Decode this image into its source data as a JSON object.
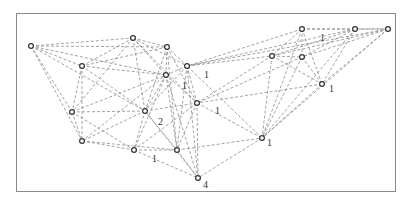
{
  "diagram": {
    "type": "network-graph",
    "edge_style": "dashed",
    "edge_color": "#8c8c8c",
    "node_color": "#333333",
    "nodes": [
      {
        "id": "A",
        "x": 31,
        "y": 46
      },
      {
        "id": "B",
        "x": 133,
        "y": 38
      },
      {
        "id": "C",
        "x": 167,
        "y": 47
      },
      {
        "id": "D",
        "x": 82,
        "y": 66
      },
      {
        "id": "E",
        "x": 187,
        "y": 66
      },
      {
        "id": "F",
        "x": 166,
        "y": 75
      },
      {
        "id": "G",
        "x": 302,
        "y": 29
      },
      {
        "id": "H",
        "x": 355,
        "y": 29
      },
      {
        "id": "I",
        "x": 388,
        "y": 29
      },
      {
        "id": "J",
        "x": 272,
        "y": 56
      },
      {
        "id": "K",
        "x": 302,
        "y": 57
      },
      {
        "id": "L",
        "x": 322,
        "y": 84
      },
      {
        "id": "M",
        "x": 72,
        "y": 112
      },
      {
        "id": "N",
        "x": 145,
        "y": 111
      },
      {
        "id": "O",
        "x": 197,
        "y": 103
      },
      {
        "id": "P",
        "x": 82,
        "y": 141
      },
      {
        "id": "Q",
        "x": 134,
        "y": 150
      },
      {
        "id": "R",
        "x": 177,
        "y": 150
      },
      {
        "id": "S",
        "x": 262,
        "y": 138
      },
      {
        "id": "T",
        "x": 198,
        "y": 178
      }
    ],
    "labels": [
      {
        "text": "1",
        "x": 204,
        "y": 78
      },
      {
        "text": "1",
        "x": 182,
        "y": 89
      },
      {
        "text": "1",
        "x": 320,
        "y": 41
      },
      {
        "text": "1",
        "x": 329,
        "y": 92
      },
      {
        "text": "2",
        "x": 158,
        "y": 125
      },
      {
        "text": "1",
        "x": 215,
        "y": 114
      },
      {
        "text": "1",
        "x": 152,
        "y": 162
      },
      {
        "text": "1",
        "x": 267,
        "y": 146
      },
      {
        "text": "4",
        "x": 203,
        "y": 188
      }
    ]
  }
}
